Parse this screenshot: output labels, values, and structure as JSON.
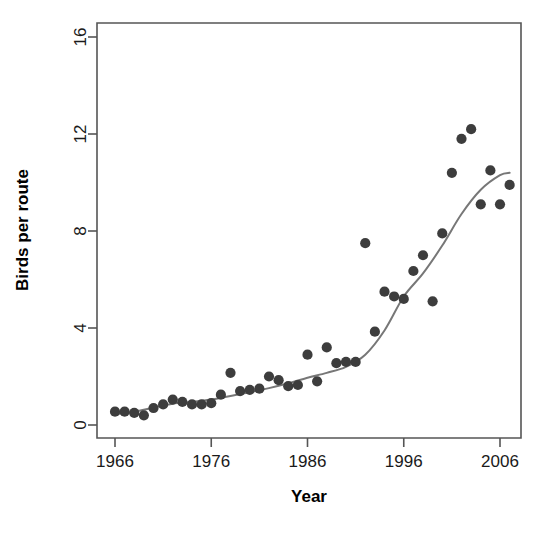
{
  "chart_data": {
    "type": "scatter",
    "title": "",
    "xlabel": "Year",
    "ylabel": "Birds per route",
    "xlim": [
      1965.0,
      2007.5
    ],
    "ylim": [
      -0.6,
      16.5
    ],
    "xticks": [
      1966,
      1976,
      1986,
      1996,
      2006
    ],
    "yticks": [
      0,
      4,
      8,
      12,
      16
    ],
    "xtick_labels": [
      "1966",
      "1976",
      "1986",
      "1996",
      "2006"
    ],
    "ytick_labels": [
      "0",
      "4",
      "8",
      "12",
      "16"
    ],
    "grid": false,
    "legend": false,
    "point_color": "#3d3d3d",
    "line_color": "#777777",
    "series": [
      {
        "name": "Birds per route",
        "marker": "filled-circle",
        "x": [
          1966,
          1967,
          1968,
          1969,
          1970,
          1971,
          1972,
          1973,
          1974,
          1975,
          1976,
          1977,
          1978,
          1979,
          1980,
          1981,
          1982,
          1983,
          1984,
          1985,
          1986,
          1987,
          1988,
          1989,
          1990,
          1991,
          1992,
          1993,
          1994,
          1995,
          1996,
          1997,
          1998,
          1999,
          2000,
          2001,
          2002,
          2003,
          2004,
          2005,
          2006,
          2007
        ],
        "y": [
          0.55,
          0.55,
          0.5,
          0.4,
          0.7,
          0.85,
          1.05,
          0.95,
          0.85,
          0.85,
          0.9,
          1.25,
          2.15,
          1.4,
          1.45,
          1.5,
          2.0,
          1.85,
          1.6,
          1.65,
          2.9,
          1.8,
          3.2,
          2.55,
          2.6,
          2.6,
          7.5,
          3.85,
          5.5,
          5.3,
          5.2,
          6.35,
          7.0,
          5.1,
          7.9,
          10.4,
          11.8,
          12.2,
          9.1,
          10.5,
          9.1,
          9.9
        ]
      },
      {
        "name": "loess smooth",
        "type": "line",
        "x": [
          1966,
          1968,
          1970,
          1972,
          1974,
          1976,
          1978,
          1980,
          1982,
          1984,
          1986,
          1988,
          1990,
          1992,
          1994,
          1996,
          1998,
          2000,
          2002,
          2004,
          2006,
          2007
        ],
        "y": [
          0.45,
          0.55,
          0.72,
          0.88,
          0.95,
          1.05,
          1.2,
          1.35,
          1.52,
          1.72,
          1.95,
          2.15,
          2.4,
          2.9,
          3.9,
          5.3,
          6.25,
          7.4,
          8.7,
          9.7,
          10.3,
          10.4
        ]
      }
    ]
  },
  "figure": {
    "axis_title_x": "Year",
    "axis_title_y": "Birds per route"
  }
}
